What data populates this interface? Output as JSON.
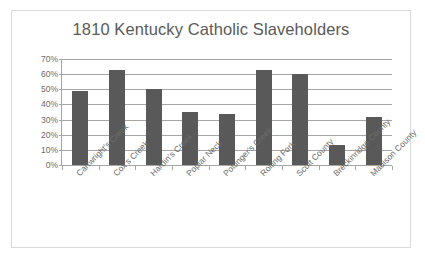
{
  "chart_data": {
    "type": "bar",
    "title": "1810 Kentucky Catholic Slaveholders",
    "xlabel": "",
    "ylabel": "",
    "ylim": [
      0,
      70
    ],
    "ytick_labels": [
      "0%",
      "10%",
      "20%",
      "30%",
      "40%",
      "50%",
      "60%",
      "70%"
    ],
    "ytick_values": [
      0,
      10,
      20,
      30,
      40,
      50,
      60,
      70
    ],
    "grid": true,
    "legend": "none",
    "bar_color": "#595959",
    "categories": [
      "Cartwright's Creek",
      "Cox's Creek",
      "Hardin's Creek",
      "Poplar Neck",
      "Pottinger's Creek",
      "Rolling Fork",
      "Scott County",
      "Breckinridge County",
      "Madison County"
    ],
    "values": [
      49,
      63,
      50,
      35,
      34,
      63,
      60,
      13,
      32
    ]
  },
  "colors": {
    "bar": "#595959",
    "title": "#5a5a5a",
    "axis": "#a6a6a6",
    "tick_text": "#6b6b6b",
    "frame_border": "#d9d9d9",
    "background": "#ffffff"
  }
}
